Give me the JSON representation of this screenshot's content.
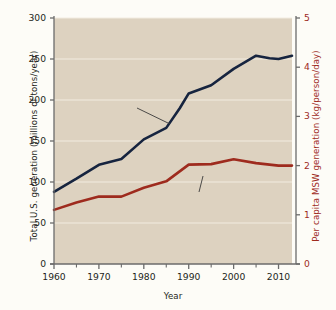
{
  "chart_data": {
    "type": "line",
    "title": "",
    "xlabel": "Year",
    "ylabel": "Total U.S. generation (millions of tons/year)",
    "ylabel_right": "Per capita MSW generation (kg/person/day)",
    "xlim": [
      1960,
      2013
    ],
    "ylim": [
      0,
      300
    ],
    "ylim_right": [
      0,
      5
    ],
    "grid": true,
    "legend_position": "inline-annotations",
    "plot_background": "#ddd2c0",
    "xticks": [
      1960,
      1970,
      1980,
      1990,
      2000,
      2010
    ],
    "xticklabels": [
      "1960",
      "1970",
      "1980",
      "1990",
      "2000",
      "2010"
    ],
    "xminorticks": [
      1965,
      1975,
      1985,
      1995,
      2005
    ],
    "yticks": [
      0,
      50,
      100,
      150,
      200,
      250,
      300
    ],
    "yticklabels": [
      "0",
      "50",
      "100",
      "150",
      "200",
      "250",
      "300"
    ],
    "yticks_right": [
      0,
      1,
      2,
      3,
      4,
      5
    ],
    "yticklabels_right": [
      "0",
      "1",
      "2",
      "3",
      "4",
      "5"
    ],
    "series": [
      {
        "name": "Total waste generation",
        "axis": "left",
        "color": "#16243f",
        "x": [
          1960,
          1965,
          1970,
          1975,
          1980,
          1985,
          1988,
          1990,
          1995,
          2000,
          2005,
          2008,
          2010,
          2013
        ],
        "values": [
          88,
          104,
          121,
          128,
          152,
          166,
          190,
          208,
          218,
          238,
          254,
          251,
          250,
          254
        ]
      },
      {
        "name": "Per capita waste generation",
        "axis": "right",
        "color": "#9e2b1e",
        "x": [
          1960,
          1965,
          1970,
          1975,
          1980,
          1985,
          1990,
          1995,
          2000,
          2005,
          2010,
          2013
        ],
        "values": [
          1.1,
          1.25,
          1.37,
          1.37,
          1.55,
          1.68,
          2.02,
          2.03,
          2.13,
          2.05,
          2.0,
          2.0
        ]
      }
    ],
    "annotations": [
      {
        "name": "total-waste-generation-label",
        "text_line1": "Total waste",
        "text_line2": "generation"
      },
      {
        "name": "per-capita-waste-generation-label",
        "text_line1": "Per capita",
        "text_line2": "waste generation"
      }
    ]
  },
  "axes": {
    "x_title": "Year",
    "y_left_title": "Total U.S. generation (millions of tons/year)",
    "y_right_title": "Per capita MSW generation (kg/person/day)"
  },
  "colors": {
    "navy": "#16243f",
    "dark_red": "#9e2b1e",
    "plot_bg": "#ddd2c0",
    "page_bg": "#fdfcf7",
    "axis": "#6b6b6b",
    "text": "#231f20"
  }
}
